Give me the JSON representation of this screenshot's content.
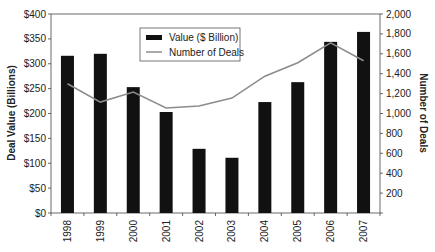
{
  "chart_data": {
    "type": "bar+line",
    "title": "",
    "categories": [
      "1998",
      "1999",
      "2000",
      "2001",
      "2002",
      "2003",
      "2004",
      "2005",
      "2006",
      "2007"
    ],
    "series": [
      {
        "name": "Value ($ Billion)",
        "type": "bar",
        "axis": "left",
        "color": "#111111",
        "values": [
          316,
          320,
          253,
          203,
          129,
          111,
          223,
          263,
          344,
          364
        ]
      },
      {
        "name": "Number of Deals",
        "type": "line",
        "axis": "right",
        "color": "#8c8c8c",
        "values": [
          1300,
          1115,
          1215,
          1055,
          1075,
          1155,
          1375,
          1510,
          1710,
          1530
        ]
      }
    ],
    "xlabel": "",
    "ylabel": "Deal Value (Billions)",
    "y2label": "Number of Deals",
    "ylim": [
      0,
      400
    ],
    "y2lim": [
      0,
      2000
    ],
    "yticks": [
      "$0",
      "$50",
      "$100",
      "$150",
      "$200",
      "$250",
      "$300",
      "$350",
      "$400"
    ],
    "y2ticks": [
      "",
      "200",
      "400",
      "600",
      "800",
      "1,000",
      "1,200",
      "1,400",
      "1,600",
      "1,800",
      "2,000"
    ],
    "grid": false,
    "legend_position": "top-center-left, inside plot"
  },
  "legend": {
    "bar_label": "Value ($ Billion)",
    "line_label": "Number of Deals"
  },
  "axes": {
    "left_title": "Deal Value (Billions)",
    "right_title": "Number of Deals"
  }
}
